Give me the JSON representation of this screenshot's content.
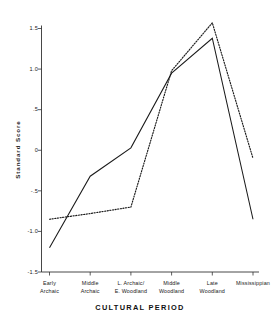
{
  "chart_data": {
    "type": "line",
    "title": "",
    "xlabel": "CULTURAL PERIOD",
    "ylabel": "Standard Score",
    "categories": [
      "Early Archaic",
      "Middle Archaic",
      "L. Archaic/ E. Woodland",
      "Middle Woodland",
      "Late Woodland",
      "Mississippian"
    ],
    "category_lines": [
      [
        "Early",
        "Archaic"
      ],
      [
        "Middle",
        "Archaic"
      ],
      [
        "L. Archaic/",
        "E. Woodland"
      ],
      [
        "Middle",
        "Woodland"
      ],
      [
        "Late",
        "Woodland"
      ],
      [
        "Mississippian"
      ]
    ],
    "ylim": [
      -1.5,
      1.5
    ],
    "ytick_values": [
      1.5,
      1.0,
      0.5,
      0.0,
      -0.5,
      -1.0,
      -1.5
    ],
    "ytick_labels": [
      "1.5",
      "1.0",
      ".5",
      "0",
      "-.5",
      "-1.0",
      "-1.5"
    ],
    "grid": false,
    "legend": "none",
    "series": [
      {
        "name": "solid-series",
        "style": "solid",
        "color": "#1a1a1a",
        "values": [
          -1.2,
          -0.32,
          0.03,
          0.95,
          1.38,
          -0.85
        ]
      },
      {
        "name": "dotted-series",
        "style": "dotted",
        "color": "#1a1a1a",
        "values": [
          -0.85,
          -0.78,
          -0.7,
          0.98,
          1.57,
          -0.1
        ]
      }
    ]
  }
}
